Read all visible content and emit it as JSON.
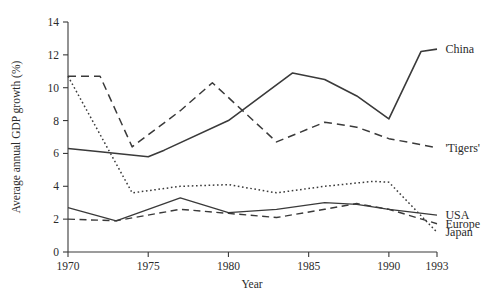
{
  "chart_data": {
    "type": "line",
    "title": "",
    "subtitle": "",
    "xlabel": "Year",
    "ylabel": "Average annual GDP growth (%)",
    "xlim": [
      1970,
      1993
    ],
    "ylim": [
      0,
      14
    ],
    "grid": false,
    "legend_position": "right-inline-labels",
    "x_ticks": [
      1970,
      1975,
      1980,
      1985,
      1990,
      1993
    ],
    "x_tick_labels": [
      "1970",
      "1975",
      "1980",
      "1985",
      "1990",
      "1993"
    ],
    "y_ticks": [
      0,
      2,
      4,
      6,
      8,
      10,
      12,
      14
    ],
    "y_tick_labels": [
      "0",
      "2",
      "4",
      "6",
      "8",
      "10",
      "12",
      "14"
    ],
    "series": [
      {
        "name": "China",
        "label": "China",
        "style": "solid",
        "label_x": 1993.4,
        "label_y": 12.35,
        "points": [
          [
            1970,
            6.3
          ],
          [
            1972,
            6.1
          ],
          [
            1975,
            5.8
          ],
          [
            1976,
            6.2
          ],
          [
            1980,
            8.0
          ],
          [
            1984,
            10.9
          ],
          [
            1986,
            10.5
          ],
          [
            1988,
            9.5
          ],
          [
            1990,
            8.1
          ],
          [
            1992,
            12.2
          ],
          [
            1993,
            12.35
          ]
        ]
      },
      {
        "name": "Tigers",
        "label": "'Tigers'",
        "style": "dashed",
        "label_x": 1993.4,
        "label_y": 6.35,
        "points": [
          [
            1970,
            10.7
          ],
          [
            1972,
            10.7
          ],
          [
            1974,
            6.4
          ],
          [
            1977,
            8.6
          ],
          [
            1979,
            10.3
          ],
          [
            1983,
            6.7
          ],
          [
            1986,
            7.9
          ],
          [
            1988,
            7.6
          ],
          [
            1990,
            6.9
          ],
          [
            1993,
            6.35
          ]
        ]
      },
      {
        "name": "Japan",
        "label": "Japan",
        "style": "dotted",
        "label_x": 1993.4,
        "label_y": 1.2,
        "points": [
          [
            1970,
            10.7
          ],
          [
            1974,
            3.6
          ],
          [
            1977,
            4.0
          ],
          [
            1980,
            4.1
          ],
          [
            1983,
            3.6
          ],
          [
            1986,
            4.0
          ],
          [
            1989,
            4.3
          ],
          [
            1990,
            4.25
          ],
          [
            1993,
            1.2
          ]
        ]
      },
      {
        "name": "USA",
        "label": "USA",
        "style": "solid",
        "label_x": 1993.4,
        "label_y": 2.25,
        "points": [
          [
            1970,
            2.7
          ],
          [
            1973,
            1.9
          ],
          [
            1977,
            3.3
          ],
          [
            1980,
            2.4
          ],
          [
            1983,
            2.6
          ],
          [
            1986,
            3.0
          ],
          [
            1988,
            2.9
          ],
          [
            1990,
            2.6
          ],
          [
            1993,
            2.25
          ]
        ]
      },
      {
        "name": "Europe",
        "label": "Europe",
        "style": "dashed",
        "label_x": 1993.4,
        "label_y": 1.72,
        "points": [
          [
            1970,
            2.0
          ],
          [
            1973,
            1.9
          ],
          [
            1977,
            2.6
          ],
          [
            1980,
            2.35
          ],
          [
            1983,
            2.1
          ],
          [
            1986,
            2.6
          ],
          [
            1988,
            2.95
          ],
          [
            1990,
            2.6
          ],
          [
            1993,
            1.72
          ]
        ]
      }
    ]
  },
  "axes": {
    "y_title": "Average annual GDP growth (%)",
    "x_title": "Year"
  }
}
